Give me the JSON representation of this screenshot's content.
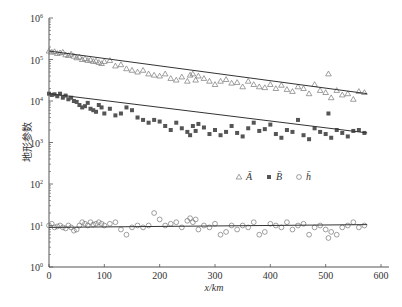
{
  "chart_data": {
    "type": "scatter",
    "title": "",
    "xlabel": "x/km",
    "ylabel": "地形参数",
    "xlim": [
      0,
      600
    ],
    "ylim": [
      1,
      1000000
    ],
    "yscale": "log",
    "x_ticks": [
      0,
      100,
      200,
      300,
      400,
      500,
      600
    ],
    "y_ticks": [
      1,
      10,
      100,
      1000,
      10000,
      100000,
      1000000
    ],
    "y_tick_labels": [
      "10^0",
      "10^1",
      "10^2",
      "10^3",
      "10^4",
      "10^5",
      "10^6"
    ],
    "grid": false,
    "legend": {
      "position": "center-right",
      "entries": [
        {
          "symbol": "triangle-open",
          "label": "Ā"
        },
        {
          "symbol": "square-filled",
          "label": "B̄"
        },
        {
          "symbol": "circle-open",
          "label": "h̄"
        }
      ]
    },
    "series": [
      {
        "name": "Ā",
        "marker": "triangle-open",
        "fit_line": {
          "x": [
            0,
            575
          ],
          "y": [
            160000,
            15000
          ]
        },
        "x": [
          0,
          5,
          10,
          15,
          20,
          25,
          30,
          35,
          40,
          45,
          50,
          55,
          60,
          65,
          70,
          75,
          80,
          85,
          90,
          95,
          100,
          110,
          120,
          130,
          140,
          150,
          160,
          170,
          180,
          190,
          200,
          210,
          220,
          230,
          240,
          250,
          255,
          260,
          265,
          270,
          280,
          290,
          300,
          310,
          320,
          330,
          340,
          350,
          360,
          370,
          380,
          390,
          400,
          410,
          420,
          430,
          440,
          450,
          460,
          470,
          480,
          490,
          500,
          505,
          510,
          520,
          530,
          540,
          550,
          560,
          570
        ],
        "y": [
          160000,
          150000,
          155000,
          140000,
          145000,
          150000,
          130000,
          125000,
          135000,
          120000,
          110000,
          115000,
          100000,
          105000,
          95000,
          98000,
          90000,
          92000,
          85000,
          80000,
          90000,
          95000,
          70000,
          75000,
          60000,
          55000,
          50000,
          55000,
          45000,
          42000,
          40000,
          45000,
          35000,
          32000,
          38000,
          30000,
          42000,
          45000,
          32000,
          40000,
          35000,
          30000,
          25000,
          30000,
          33000,
          27000,
          28000,
          22000,
          30000,
          25000,
          22000,
          21000,
          25000,
          20000,
          24000,
          19000,
          17000,
          22000,
          20000,
          15000,
          25000,
          18000,
          16000,
          45000,
          12000,
          18000,
          14000,
          15000,
          11000,
          17000,
          16000
        ]
      },
      {
        "name": "B̄",
        "marker": "square-filled",
        "fit_line": {
          "x": [
            0,
            575
          ],
          "y": [
            15000,
            1700
          ]
        },
        "x": [
          0,
          5,
          10,
          15,
          20,
          25,
          30,
          35,
          40,
          45,
          50,
          55,
          60,
          65,
          70,
          75,
          80,
          85,
          90,
          95,
          100,
          110,
          120,
          130,
          140,
          150,
          160,
          170,
          180,
          190,
          200,
          210,
          220,
          230,
          240,
          250,
          255,
          260,
          265,
          270,
          280,
          290,
          300,
          310,
          320,
          330,
          340,
          350,
          360,
          370,
          380,
          390,
          400,
          410,
          420,
          430,
          440,
          450,
          460,
          470,
          480,
          490,
          500,
          505,
          510,
          520,
          530,
          540,
          550,
          560,
          570
        ],
        "y": [
          15000,
          14000,
          14500,
          13000,
          15000,
          12000,
          13500,
          11000,
          12000,
          10000,
          9500,
          8000,
          7000,
          7500,
          9000,
          6500,
          6000,
          5500,
          8000,
          7000,
          5000,
          6500,
          4500,
          5000,
          7000,
          6000,
          4000,
          3500,
          3000,
          3500,
          3200,
          2500,
          2000,
          3000,
          2200,
          1800,
          1500,
          2500,
          1900,
          2800,
          2300,
          1600,
          2000,
          1500,
          1800,
          2500,
          1700,
          1400,
          2200,
          3000,
          1900,
          2100,
          2700,
          1600,
          1300,
          2000,
          1800,
          3500,
          1500,
          1200,
          2200,
          1800,
          1600,
          5000,
          1300,
          2000,
          1700,
          1400,
          1900,
          2000,
          1700
        ]
      },
      {
        "name": "h̄",
        "marker": "circle-open",
        "fit_line": {
          "x": [
            0,
            575
          ],
          "y": [
            9,
            10.5
          ]
        },
        "x": [
          0,
          5,
          10,
          15,
          20,
          25,
          30,
          35,
          40,
          45,
          50,
          55,
          60,
          65,
          70,
          75,
          80,
          85,
          90,
          95,
          100,
          110,
          120,
          130,
          140,
          150,
          160,
          170,
          180,
          190,
          200,
          210,
          220,
          230,
          240,
          250,
          255,
          260,
          265,
          270,
          280,
          290,
          300,
          310,
          320,
          330,
          340,
          350,
          360,
          370,
          380,
          390,
          400,
          410,
          420,
          430,
          440,
          450,
          460,
          470,
          480,
          490,
          500,
          505,
          510,
          520,
          530,
          540,
          550,
          560,
          570
        ],
        "y": [
          10,
          11,
          9,
          9.5,
          10,
          9,
          8.5,
          10,
          9,
          7.5,
          8,
          10,
          12,
          11,
          10,
          12,
          10.5,
          11,
          12,
          11,
          10,
          11,
          12,
          8,
          6,
          9,
          10,
          9,
          10,
          20,
          14,
          10,
          11,
          12,
          9,
          13,
          15,
          12,
          14,
          8,
          10,
          9,
          11,
          6,
          7,
          10,
          8,
          10,
          9,
          12,
          6,
          7,
          11,
          10,
          9,
          12,
          8,
          10,
          11,
          6,
          9,
          10,
          8,
          5,
          7,
          6,
          9,
          10,
          12,
          9,
          10
        ]
      }
    ]
  }
}
